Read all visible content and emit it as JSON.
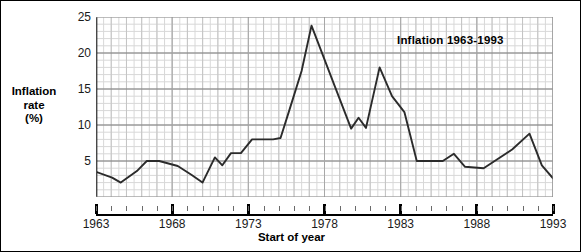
{
  "chart_data": {
    "type": "line",
    "title": "Inflation 1963-1993",
    "xlabel": "Start of year",
    "ylabel": "Inflation rate (%)",
    "ylabel_lines": [
      "Inflation",
      "rate",
      "(%)"
    ],
    "xlim": [
      1963,
      1993
    ],
    "ylim": [
      0,
      25
    ],
    "grid": true,
    "grid_major_y": [
      5,
      10,
      15,
      20,
      25
    ],
    "grid_minor_step": 1,
    "legend": "none",
    "y_ticks": [
      {
        "value": 25,
        "label": "25"
      },
      {
        "value": 20,
        "label": "20"
      },
      {
        "value": 15,
        "label": "15"
      },
      {
        "value": 10,
        "label": "10"
      },
      {
        "value": 5,
        "label": "5"
      }
    ],
    "x_ticks": [
      {
        "value": 1963,
        "label": "1963"
      },
      {
        "value": 1968,
        "label": "1968"
      },
      {
        "value": 1973,
        "label": "1973"
      },
      {
        "value": 1978,
        "label": "1978"
      },
      {
        "value": 1983,
        "label": "1983"
      },
      {
        "value": 1988,
        "label": "1988"
      },
      {
        "value": 1993,
        "label": "1993"
      }
    ],
    "x": [
      1963,
      1964,
      1965,
      1966,
      1967,
      1968,
      1969,
      1970,
      1971,
      1972,
      1973,
      1974,
      1975,
      1976,
      1977,
      1978,
      1979,
      1980,
      1981,
      1982,
      1983,
      1984,
      1985,
      1986,
      1987,
      1988,
      1989,
      1990,
      1991,
      1992,
      1993
    ],
    "values": [
      3.5,
      2.8,
      2.0,
      4.0,
      5.0,
      5.0,
      4.5,
      3.0,
      2.0,
      5.5,
      4.5,
      6.0,
      8.0,
      8.0,
      8.0,
      12.0,
      17.5,
      23.8,
      19.5,
      15.5,
      12.0,
      9.5,
      14.0,
      18.0,
      15.0,
      12.0,
      8.0,
      5.0,
      5.0,
      5.0,
      6.0
    ],
    "series": [
      {
        "name": "Inflation rate",
        "color": "#2b2b2b",
        "points": [
          {
            "x": 1963.0,
            "y": 3.5
          },
          {
            "x": 1964.3,
            "y": 2.7
          },
          {
            "x": 1965.0,
            "y": 2.0
          },
          {
            "x": 1966.3,
            "y": 3.6
          },
          {
            "x": 1967.1,
            "y": 5.0
          },
          {
            "x": 1968.1,
            "y": 5.0
          },
          {
            "x": 1969.6,
            "y": 4.3
          },
          {
            "x": 1970.7,
            "y": 3.1
          },
          {
            "x": 1971.6,
            "y": 2.0
          },
          {
            "x": 1972.6,
            "y": 5.5
          },
          {
            "x": 1973.2,
            "y": 4.4
          },
          {
            "x": 1973.9,
            "y": 6.1
          },
          {
            "x": 1974.7,
            "y": 6.1
          },
          {
            "x": 1975.6,
            "y": 8.0
          },
          {
            "x": 1977.3,
            "y": 8.0
          },
          {
            "x": 1977.9,
            "y": 8.2
          },
          {
            "x": 1978.6,
            "y": 12.0
          },
          {
            "x": 1979.6,
            "y": 17.5
          },
          {
            "x": 1980.4,
            "y": 23.8
          },
          {
            "x": 1982.3,
            "y": 15.3
          },
          {
            "x": 1983.6,
            "y": 9.5
          },
          {
            "x": 1984.2,
            "y": 11.0
          },
          {
            "x": 1984.8,
            "y": 9.6
          },
          {
            "x": 1985.9,
            "y": 18.0
          },
          {
            "x": 1986.9,
            "y": 14.0
          },
          {
            "x": 1987.9,
            "y": 11.8
          },
          {
            "x": 1988.9,
            "y": 5.0
          },
          {
            "x": 1991.0,
            "y": 5.0
          },
          {
            "x": 1991.9,
            "y": 6.0
          },
          {
            "x": 1992.8,
            "y": 4.2
          },
          {
            "x": 1994.3,
            "y": 4.0
          },
          {
            "x": 1996.6,
            "y": 6.6
          },
          {
            "x": 1998.0,
            "y": 8.8
          },
          {
            "x": 1999.0,
            "y": 4.4
          },
          {
            "x": 1999.9,
            "y": 2.6
          }
        ]
      }
    ]
  },
  "axis": {
    "y_caption_line1": "Inflation",
    "y_caption_line2": "rate",
    "y_caption_line3": "(%)",
    "x_caption": "Start of year"
  },
  "colors": {
    "line": "#2b2b2b",
    "grid_minor": "#d8d8d8",
    "grid_major": "#7a7a7a",
    "axis": "#000000",
    "background": "#ffffff"
  }
}
